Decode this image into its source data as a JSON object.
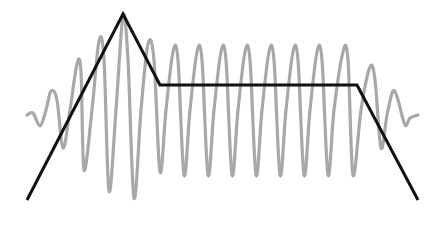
{
  "diagram": {
    "type": "adsr-envelope",
    "colors": {
      "background": "#ffffff",
      "envelope": "#111111",
      "waveform": "#a8a8a8"
    },
    "envelope_points": [
      [
        27,
        200
      ],
      [
        123,
        14
      ],
      [
        160,
        85
      ],
      [
        357,
        85
      ],
      [
        418,
        200
      ]
    ],
    "waveform_points": [
      [
        27,
        115
      ],
      [
        33,
        113
      ],
      [
        40,
        126
      ],
      [
        46,
        110
      ],
      [
        51,
        91
      ],
      [
        57,
        100
      ],
      [
        63,
        148
      ],
      [
        70,
        110
      ],
      [
        77,
        64
      ],
      [
        81,
        72
      ],
      [
        84,
        170
      ],
      [
        92,
        110
      ],
      [
        99,
        41
      ],
      [
        104,
        60
      ],
      [
        109,
        191
      ],
      [
        116,
        110
      ],
      [
        123,
        16
      ],
      [
        128,
        60
      ],
      [
        134,
        198
      ],
      [
        141,
        110
      ],
      [
        148,
        44
      ],
      [
        154,
        60
      ],
      [
        160,
        172
      ],
      [
        166,
        110
      ],
      [
        173,
        52
      ],
      [
        178,
        60
      ],
      [
        184,
        175
      ],
      [
        190,
        110
      ],
      [
        197,
        52
      ],
      [
        202,
        60
      ],
      [
        208,
        175
      ],
      [
        214,
        110
      ],
      [
        221,
        52
      ],
      [
        226,
        60
      ],
      [
        232,
        175
      ],
      [
        238,
        110
      ],
      [
        245,
        52
      ],
      [
        250,
        60
      ],
      [
        256,
        175
      ],
      [
        262,
        110
      ],
      [
        269,
        52
      ],
      [
        274,
        60
      ],
      [
        280,
        175
      ],
      [
        286,
        110
      ],
      [
        293,
        52
      ],
      [
        298,
        60
      ],
      [
        304,
        175
      ],
      [
        310,
        110
      ],
      [
        317,
        52
      ],
      [
        322,
        60
      ],
      [
        328,
        175
      ],
      [
        334,
        110
      ],
      [
        343,
        52
      ],
      [
        348,
        60
      ],
      [
        353,
        175
      ],
      [
        361,
        110
      ],
      [
        370,
        67
      ],
      [
        375,
        80
      ],
      [
        381,
        148
      ],
      [
        387,
        115
      ],
      [
        393,
        91
      ],
      [
        398,
        100
      ],
      [
        405,
        125
      ],
      [
        410,
        118
      ],
      [
        418,
        115
      ]
    ]
  }
}
